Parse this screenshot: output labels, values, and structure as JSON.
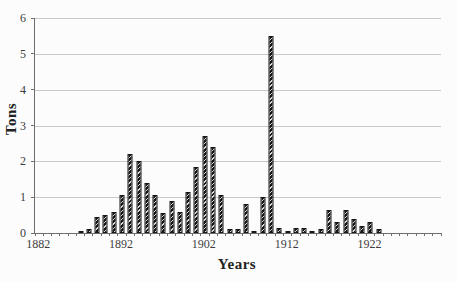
{
  "colors": {
    "background": "#fcfcfc",
    "axis": "#6e6e6e",
    "gridline": "#c9c9c9",
    "bar_dark": "#161616",
    "bar_hatch_light": "#d9d9d9",
    "title_text": "#222222",
    "tick_text": "#3d3d3d"
  },
  "chart_data": {
    "type": "bar",
    "title": "",
    "xlabel": "Years",
    "ylabel": "Tons",
    "ylim": [
      0,
      6
    ],
    "y_ticks": [
      0,
      1,
      2,
      3,
      4,
      5,
      6
    ],
    "x_range": [
      1882,
      1930
    ],
    "x_tick_years": [
      1882,
      1892,
      1902,
      1912,
      1922
    ],
    "x_tick_labels": [
      "1882",
      "1892",
      "1902",
      "1912",
      "1922"
    ],
    "grid": "horizontal",
    "legend": "none",
    "bar_style": "black-diagonal-hatch",
    "bars": [
      {
        "year": 1887,
        "tons": 0.05
      },
      {
        "year": 1888,
        "tons": 0.1
      },
      {
        "year": 1889,
        "tons": 0.45
      },
      {
        "year": 1890,
        "tons": 0.5
      },
      {
        "year": 1891,
        "tons": 0.6
      },
      {
        "year": 1892,
        "tons": 1.05
      },
      {
        "year": 1893,
        "tons": 2.2
      },
      {
        "year": 1894,
        "tons": 2.0
      },
      {
        "year": 1895,
        "tons": 1.4
      },
      {
        "year": 1896,
        "tons": 1.05
      },
      {
        "year": 1897,
        "tons": 0.55
      },
      {
        "year": 1898,
        "tons": 0.9
      },
      {
        "year": 1899,
        "tons": 0.6
      },
      {
        "year": 1900,
        "tons": 1.15
      },
      {
        "year": 1901,
        "tons": 1.85
      },
      {
        "year": 1902,
        "tons": 2.7
      },
      {
        "year": 1903,
        "tons": 2.4
      },
      {
        "year": 1904,
        "tons": 1.05
      },
      {
        "year": 1905,
        "tons": 0.1
      },
      {
        "year": 1906,
        "tons": 0.1
      },
      {
        "year": 1907,
        "tons": 0.8
      },
      {
        "year": 1908,
        "tons": 0.05
      },
      {
        "year": 1909,
        "tons": 1.0
      },
      {
        "year": 1910,
        "tons": 5.5
      },
      {
        "year": 1911,
        "tons": 0.15
      },
      {
        "year": 1912,
        "tons": 0.05
      },
      {
        "year": 1913,
        "tons": 0.15
      },
      {
        "year": 1914,
        "tons": 0.15
      },
      {
        "year": 1915,
        "tons": 0.05
      },
      {
        "year": 1916,
        "tons": 0.1
      },
      {
        "year": 1917,
        "tons": 0.65
      },
      {
        "year": 1918,
        "tons": 0.3
      },
      {
        "year": 1919,
        "tons": 0.65
      },
      {
        "year": 1920,
        "tons": 0.4
      },
      {
        "year": 1921,
        "tons": 0.2
      },
      {
        "year": 1922,
        "tons": 0.3
      },
      {
        "year": 1923,
        "tons": 0.1
      }
    ]
  }
}
